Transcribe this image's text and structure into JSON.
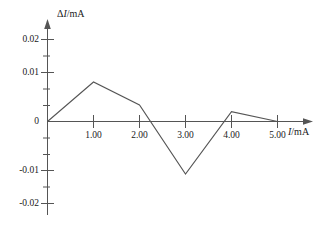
{
  "chart_data": {
    "type": "line",
    "title": "",
    "subtitle": "",
    "xlabel": "I/mA",
    "ylabel": "ΔI/mA",
    "xlim": [
      0,
      5.4
    ],
    "ylim": [
      -0.024,
      0.024
    ],
    "grid": false,
    "legend": null,
    "x": [
      0,
      1.0,
      2.0,
      3.0,
      4.0,
      5.0
    ],
    "values": [
      0,
      0.012,
      0.005,
      -0.016,
      0.003,
      0
    ],
    "series": [
      {
        "name": "ΔI vs I",
        "x": [
          0,
          1.0,
          2.0,
          3.0,
          4.0,
          5.0
        ],
        "values": [
          0,
          0.012,
          0.005,
          -0.016,
          0.003,
          0
        ]
      }
    ],
    "x_ticks": [
      1.0,
      2.0,
      3.0,
      4.0,
      5.0
    ],
    "x_tick_labels": [
      "1.00",
      "2.00",
      "3.00",
      "4.00",
      "5.00"
    ],
    "y_ticks": [
      -0.02,
      -0.01,
      0,
      0.01,
      0.02
    ],
    "y_tick_labels": [
      "-0.02",
      "-0.01",
      "0",
      "0.01",
      "0.02"
    ],
    "y_minor_tick_step": 0.005,
    "zero_crossings": [
      2.325,
      3.676,
      5.0
    ],
    "line_color": "#555555",
    "axis_color": "#555555",
    "background_color": "#ffffff"
  },
  "axes": {
    "y_axis_label_delta": "Δ",
    "y_axis_label_var": "I",
    "y_axis_label_unit": "/mA",
    "x_axis_label_var": "I",
    "x_axis_label_unit": "/mA"
  },
  "y_tick_labels": {
    "t0": "0.02",
    "t1": "0.01",
    "t2": "0",
    "t3": "-0.01",
    "t4": "-0.02"
  },
  "x_tick_labels": {
    "t0": "1.00",
    "t1": "2.00",
    "t2": "3.00",
    "t3": "4.00",
    "t4": "5.00"
  }
}
